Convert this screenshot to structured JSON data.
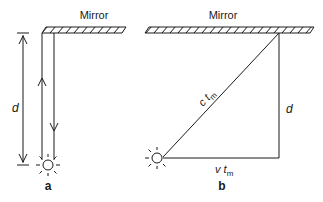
{
  "diagram": {
    "panel_a": {
      "mirror_label": "Mirror",
      "distance_label": "d",
      "panel_label": "a"
    },
    "panel_b": {
      "mirror_label": "Mirror",
      "hypotenuse_label_main": "c t",
      "hypotenuse_label_sub": "m",
      "vertical_label": "d",
      "horizontal_label_main": "v t",
      "horizontal_label_sub": "m",
      "panel_label": "b"
    },
    "colors": {
      "stroke": "#1a1a1a",
      "background": "#ffffff"
    }
  }
}
